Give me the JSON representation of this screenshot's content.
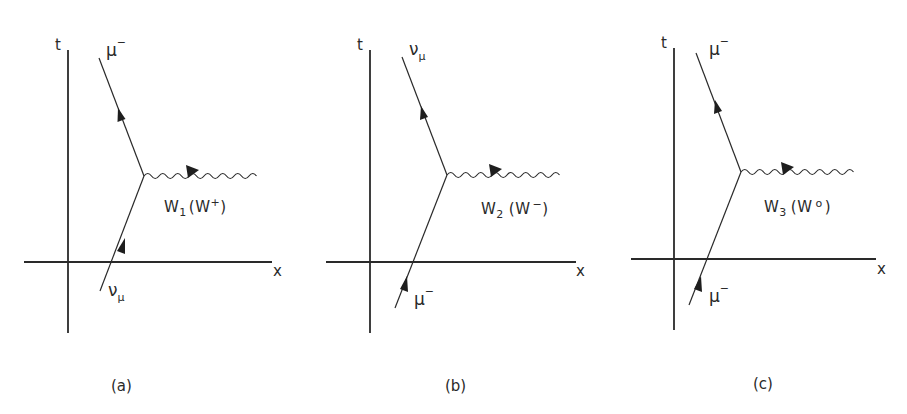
{
  "figure": {
    "panels": [
      {
        "id": "a",
        "caption": "(a)",
        "axis_t": "t",
        "axis_x": "x",
        "incoming": {
          "symbol": "ν",
          "sub": "μ",
          "sup": ""
        },
        "outgoing": {
          "symbol": "μ",
          "sub": "",
          "sup": "−"
        },
        "boson": {
          "name": "W",
          "sub": "1",
          "paren_open": "(",
          "paren_name": "W",
          "paren_sup": "+",
          "paren_close": ")"
        }
      },
      {
        "id": "b",
        "caption": "(b)",
        "axis_t": "t",
        "axis_x": "x",
        "incoming": {
          "symbol": "μ",
          "sub": "",
          "sup": "−"
        },
        "outgoing": {
          "symbol": "ν",
          "sub": "μ",
          "sup": ""
        },
        "boson": {
          "name": "W",
          "sub": "2",
          "paren_open": "(",
          "paren_name": "W",
          "paren_sup": "−",
          "paren_close": ")"
        }
      },
      {
        "id": "c",
        "caption": "(c)",
        "axis_t": "t",
        "axis_x": "x",
        "incoming": {
          "symbol": "μ",
          "sub": "",
          "sup": "−"
        },
        "outgoing": {
          "symbol": "μ",
          "sub": "",
          "sup": "−"
        },
        "boson": {
          "name": "W",
          "sub": "3",
          "paren_open": "(",
          "paren_name": "W",
          "paren_sup": "o",
          "paren_close": ")"
        }
      }
    ]
  }
}
